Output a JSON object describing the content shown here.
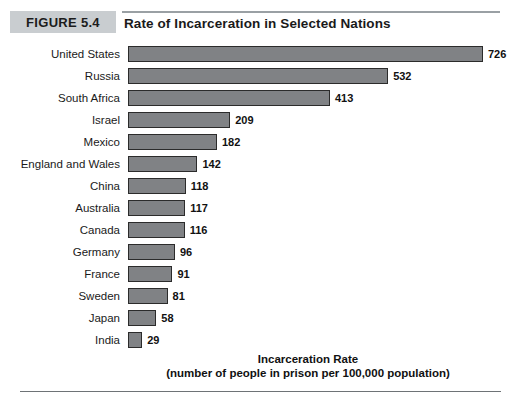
{
  "figure": {
    "badge_label": "FIGURE 5.4",
    "title": "Rate of Incarceration in Selected Nations"
  },
  "axis_caption": {
    "line1": "Incarceration Rate",
    "line2": "(number of people in prison per 100,000 population)"
  },
  "colors": {
    "bar_fill": "#808285",
    "bar_border": "#2b2b2b",
    "badge_background": "#c9cdd0",
    "rule": "#9aa0a4",
    "text": "#111111"
  },
  "chart_data": {
    "type": "bar",
    "orientation": "horizontal",
    "title": "Rate of Incarceration in Selected Nations",
    "xlabel": "Incarceration Rate (number of people in prison per 100,000 population)",
    "ylabel": "",
    "xlim": [
      0,
      726
    ],
    "grid": false,
    "legend": false,
    "categories": [
      "United States",
      "Russia",
      "South Africa",
      "Israel",
      "Mexico",
      "England and Wales",
      "China",
      "Australia",
      "Canada",
      "Germany",
      "France",
      "Sweden",
      "Japan",
      "India"
    ],
    "values": [
      726,
      532,
      413,
      209,
      182,
      142,
      118,
      117,
      116,
      96,
      91,
      81,
      58,
      29
    ],
    "value_labels": [
      "726",
      "532",
      "413",
      "209",
      "182",
      "142",
      "118",
      "117",
      "116",
      "96",
      "91",
      "81",
      "58",
      "29"
    ]
  }
}
